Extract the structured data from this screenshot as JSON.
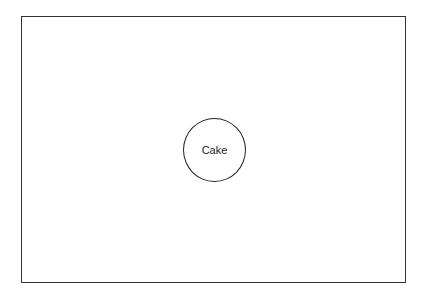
{
  "diagram": {
    "nodes": [
      {
        "id": "cake",
        "label": "Cake",
        "shape": "circle"
      }
    ],
    "edges": [],
    "colors": {
      "stroke": "#222222",
      "background": "#ffffff"
    }
  }
}
